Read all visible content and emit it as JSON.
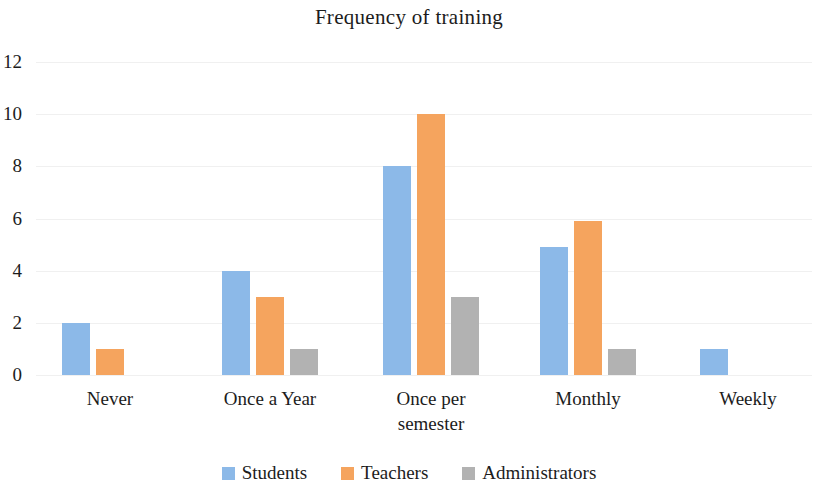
{
  "chart_data": {
    "type": "bar",
    "title": "Frequency of training",
    "xlabel": "",
    "ylabel": "",
    "ylim": [
      0,
      12
    ],
    "y_ticks": [
      0,
      2,
      4,
      6,
      8,
      10,
      12
    ],
    "grid": true,
    "legend_position": "bottom",
    "categories": [
      "Never",
      "Once a Year",
      "Once per semester",
      "Monthly",
      "Weekly"
    ],
    "category_lines": [
      [
        "Never"
      ],
      [
        "Once a Year"
      ],
      [
        "Once per",
        "semester"
      ],
      [
        "Monthly"
      ],
      [
        "Weekly"
      ]
    ],
    "series": [
      {
        "name": "Students",
        "color": "#8cb9e8",
        "values": [
          2,
          4,
          8,
          4.9,
          1
        ]
      },
      {
        "name": "Teachers",
        "color": "#f5a45e",
        "values": [
          1,
          3,
          10,
          5.9,
          0
        ]
      },
      {
        "name": "Administrators",
        "color": "#b2b2b2",
        "values": [
          0,
          1,
          3,
          1,
          0
        ]
      }
    ]
  },
  "legend": {
    "items": [
      {
        "label": "Students",
        "swatch": "students"
      },
      {
        "label": "Teachers",
        "swatch": "teachers"
      },
      {
        "label": "Administrators",
        "swatch": "administrators"
      }
    ]
  }
}
